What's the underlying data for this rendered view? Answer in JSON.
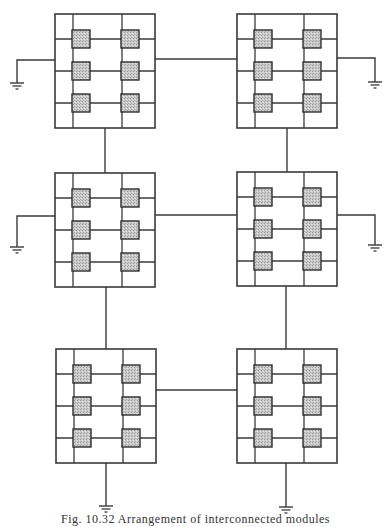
{
  "figure": {
    "caption": "Fig. 10.32   Arrangement of interconnected modules",
    "caption_visible": "Fig. 10.32"
  },
  "colors": {
    "line": "#3a3a3a",
    "pad_fill": "#c9c9c9",
    "pad_border": "#2e2e2e",
    "background": "#ffffff"
  },
  "module_template": {
    "width": 100,
    "height": 114,
    "inner_vertical_x": [
      18,
      67
    ],
    "inner_horizontal_y": [
      25,
      57,
      89
    ],
    "pad_size": 18,
    "pad_centers": [
      [
        26,
        25
      ],
      [
        75,
        25
      ],
      [
        26,
        57
      ],
      [
        75,
        57
      ],
      [
        26,
        89
      ],
      [
        75,
        89
      ]
    ]
  },
  "modules": [
    {
      "id": "module-top-left",
      "x": 55,
      "y": 14
    },
    {
      "id": "module-top-right",
      "x": 237,
      "y": 14
    },
    {
      "id": "module-middle-left",
      "x": 55,
      "y": 173
    },
    {
      "id": "module-middle-right",
      "x": 237,
      "y": 172
    },
    {
      "id": "module-bottom-left",
      "x": 56,
      "y": 349
    },
    {
      "id": "module-bottom-right",
      "x": 237,
      "y": 349
    }
  ],
  "links": [
    {
      "id": "link-top-horizontal",
      "points": [
        [
          155,
          59
        ],
        [
          237,
          59
        ]
      ]
    },
    {
      "id": "link-middle-horizontal",
      "points": [
        [
          155,
          215
        ],
        [
          237,
          215
        ]
      ]
    },
    {
      "id": "link-bottom-horizontal",
      "points": [
        [
          155,
          390
        ],
        [
          237,
          390
        ]
      ]
    },
    {
      "id": "link-left-top-to-middle",
      "points": [
        [
          105,
          128
        ],
        [
          105,
          173
        ]
      ]
    },
    {
      "id": "link-right-top-to-middle",
      "points": [
        [
          287,
          127
        ],
        [
          287,
          172
        ]
      ]
    },
    {
      "id": "link-left-middle-to-bottom",
      "points": [
        [
          106,
          287
        ],
        [
          106,
          349
        ]
      ]
    },
    {
      "id": "link-right-middle-to-bottom",
      "points": [
        [
          286,
          286
        ],
        [
          286,
          349
        ]
      ]
    }
  ],
  "grounds": [
    {
      "id": "ground-top-left",
      "points": [
        [
          55,
          60
        ],
        [
          17,
          60
        ],
        [
          17,
          83
        ]
      ]
    },
    {
      "id": "ground-top-right",
      "points": [
        [
          336,
          58
        ],
        [
          375,
          58
        ],
        [
          375,
          82
        ]
      ]
    },
    {
      "id": "ground-middle-left",
      "points": [
        [
          55,
          216
        ],
        [
          17,
          216
        ],
        [
          17,
          247
        ]
      ]
    },
    {
      "id": "ground-middle-right",
      "points": [
        [
          336,
          215
        ],
        [
          375,
          215
        ],
        [
          375,
          245
        ]
      ]
    },
    {
      "id": "ground-bottom-left",
      "points": [
        [
          106,
          463
        ],
        [
          106,
          506
        ]
      ]
    },
    {
      "id": "ground-bottom-right",
      "points": [
        [
          286,
          463
        ],
        [
          286,
          507
        ]
      ]
    }
  ]
}
